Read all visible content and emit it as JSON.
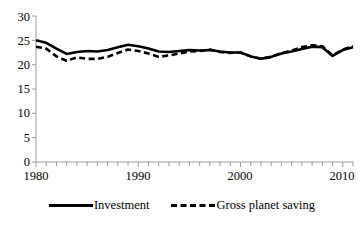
{
  "chart_data": {
    "type": "line",
    "title": "",
    "subtitle": "",
    "xlabel": "",
    "ylabel": "",
    "xlim": [
      1980,
      2011
    ],
    "ylim": [
      0,
      30
    ],
    "grid": false,
    "legend_position": "bottom",
    "y_ticks": [
      0,
      5,
      10,
      15,
      20,
      25,
      30
    ],
    "y_tick_labels": [
      "0",
      "5",
      "10",
      "15",
      "20",
      "25",
      "30"
    ],
    "x_ticks": [
      1980,
      1990,
      2000,
      2010
    ],
    "x_tick_labels": [
      "1980",
      "1990",
      "2000",
      "2010"
    ],
    "x_minor_tick_interval": 1,
    "x": [
      1980,
      1981,
      1982,
      1983,
      1984,
      1985,
      1986,
      1987,
      1988,
      1989,
      1990,
      1991,
      1992,
      1993,
      1994,
      1995,
      1996,
      1997,
      1998,
      1999,
      2000,
      2001,
      2002,
      2003,
      2004,
      2005,
      2006,
      2007,
      2008,
      2009,
      2010,
      2011
    ],
    "series": [
      {
        "name": "Investment",
        "style": "solid",
        "color": "#000000",
        "values": [
          25.0,
          24.5,
          23.3,
          22.2,
          22.6,
          22.8,
          22.7,
          23.0,
          23.6,
          24.1,
          23.8,
          23.3,
          22.7,
          22.6,
          22.8,
          23.0,
          22.9,
          23.0,
          22.7,
          22.5,
          22.5,
          21.7,
          21.2,
          21.6,
          22.3,
          22.7,
          23.2,
          23.7,
          23.6,
          21.8,
          23.0,
          23.6
        ]
      },
      {
        "name": "Gross planet saving",
        "style": "dashed",
        "color": "#000000",
        "values": [
          23.7,
          23.3,
          21.7,
          20.8,
          21.5,
          21.2,
          21.2,
          21.6,
          22.4,
          23.1,
          22.8,
          22.3,
          21.6,
          21.9,
          22.3,
          22.7,
          22.8,
          23.1,
          22.6,
          22.4,
          22.5,
          21.7,
          21.2,
          21.6,
          22.4,
          22.9,
          23.6,
          24.0,
          23.8,
          21.9,
          23.1,
          23.8
        ]
      }
    ]
  },
  "legend": {
    "items": [
      {
        "label": "Investment",
        "style": "solid"
      },
      {
        "label": "Gross planet saving",
        "style": "dashed"
      }
    ]
  }
}
